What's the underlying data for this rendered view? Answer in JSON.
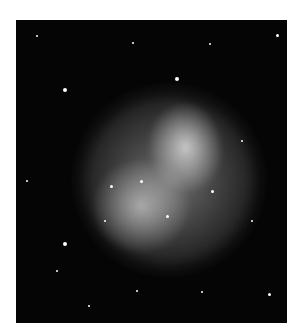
{
  "image": {
    "subject": "planetary nebula (grayscale astrophotograph)",
    "colors": {
      "background": "#ffffff",
      "sky": "#050505",
      "nebula": "#c8c8c8"
    }
  }
}
